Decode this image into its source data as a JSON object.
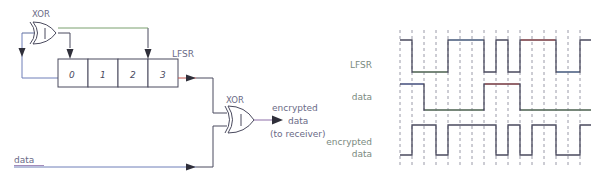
{
  "figure": {
    "bg_color": "#ffffff",
    "ink_color": "#4a4a5e",
    "text_color": "#6a6a86"
  },
  "block_diagram": {
    "feedback_gate": {
      "label": "XOR",
      "symbol_text": "|"
    },
    "output_gate": {
      "label": "XOR",
      "symbol_text": "|"
    },
    "register": {
      "name": "LFSR",
      "cells": [
        {
          "label": "0"
        },
        {
          "label": "1"
        },
        {
          "label": "2"
        },
        {
          "label": "3"
        }
      ]
    },
    "labels": {
      "lfsr_tap": "LFSR",
      "data_in": "data",
      "output_line1": "encrypted",
      "output_line2": "data",
      "output_line3": "(to receiver)"
    },
    "wire_colors": {
      "feedback": "#6e7fb8",
      "tap": "#7aa06e",
      "lfsr_out": "#c0554f",
      "data_in": "#6e7fb8",
      "cipher_out": "#8d6ea8"
    }
  },
  "timing_diagram": {
    "rows": [
      {
        "name": "lfsr",
        "label": "LFSR"
      },
      {
        "name": "data",
        "label": "data"
      },
      {
        "name": "encrypted",
        "label_line1": "encrypted",
        "label_line2": "data"
      }
    ],
    "grid": {
      "columns": 16,
      "dashed": true,
      "color": "#9a9aa8"
    }
  },
  "chart_data": {
    "type": "line",
    "xlabel": "",
    "ylabel": "",
    "grid": true,
    "x": [
      0,
      1,
      2,
      3,
      4,
      5,
      6,
      7,
      8,
      9,
      10,
      11,
      12,
      13,
      14,
      15
    ],
    "series": [
      {
        "name": "LFSR",
        "values": [
          1,
          0,
          0,
          0,
          1,
          1,
          1,
          0,
          1,
          0,
          1,
          1,
          1,
          0,
          0,
          1
        ],
        "accent_segments": [
          "#7aa06e",
          "#6e8fb8",
          "#c0554f",
          "#6e8fb8",
          "#c0554f",
          "#c0554f",
          "#b8b84f"
        ]
      },
      {
        "name": "data",
        "values": [
          1,
          1,
          0,
          0,
          0,
          0,
          0,
          1,
          1,
          1,
          0,
          0,
          0,
          0,
          0,
          0
        ],
        "accent_segments": [
          "#6e7fb8",
          "#7aa06e",
          "#c0554f",
          "#7aa06e",
          "#7aa06e",
          "#8d6ea8"
        ]
      },
      {
        "name": "encrypted data",
        "values": [
          0,
          1,
          1,
          0,
          1,
          1,
          1,
          1,
          0,
          1,
          0,
          1,
          1,
          0,
          0,
          1
        ],
        "accent_segments": []
      }
    ],
    "ylim": [
      0,
      1
    ],
    "legend": "none"
  }
}
